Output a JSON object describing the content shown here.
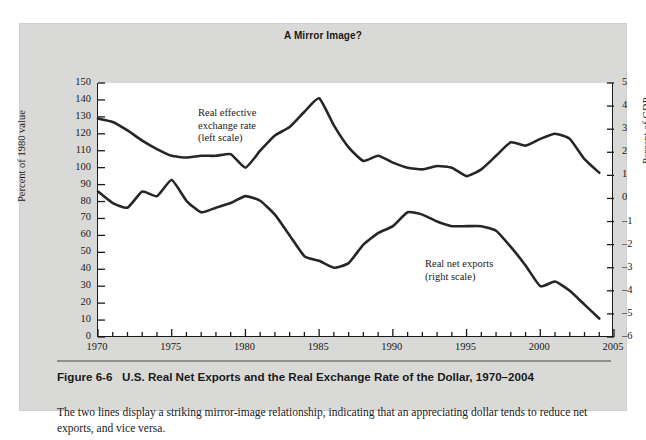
{
  "figure": {
    "panel_background": "#d9d9d7",
    "title": "A Mirror Image?",
    "heading_number": "Figure 6-6",
    "heading_text": "U.S. Real Net Exports and the Real Exchange Rate of the Dollar, 1970–2004",
    "caption": "The two lines display a striking mirror-image relationship, indicating that an appreciating dollar tends to reduce net exports, and vice versa."
  },
  "chart_data": {
    "type": "line",
    "title": "A Mirror Image?",
    "xlabel": "",
    "ylabel": "Percent of 1980 value",
    "ylabel_right": "Percent of GDP",
    "xlim": [
      1970,
      2005
    ],
    "ylim": [
      0,
      150
    ],
    "ylim_right": [
      -6,
      5
    ],
    "grid": false,
    "legend": "inline-annotations",
    "line_color": "#262626",
    "x_ticks": [
      1970,
      1975,
      1980,
      1985,
      1990,
      1995,
      2000,
      2005
    ],
    "x_minor_tick_step": 1,
    "y_ticks_left": [
      0,
      10,
      20,
      30,
      40,
      50,
      60,
      70,
      80,
      90,
      100,
      110,
      120,
      130,
      140,
      150
    ],
    "y_ticks_right": [
      -6,
      -5,
      -4,
      -3,
      -2,
      -1,
      0,
      1,
      2,
      3,
      4,
      5
    ],
    "series": [
      {
        "name": "Real effective exchange rate",
        "annotation": "Real effective\nexchange rate\n(left scale)",
        "annotation_line1": "Real effective",
        "annotation_line2": "exchange rate",
        "annotation_line3": "(left scale)",
        "axis": "left",
        "x": [
          1970,
          1971,
          1972,
          1973,
          1974,
          1975,
          1976,
          1977,
          1978,
          1979,
          1980,
          1981,
          1982,
          1983,
          1984,
          1985,
          1986,
          1987,
          1988,
          1989,
          1990,
          1991,
          1992,
          1993,
          1994,
          1995,
          1996,
          1997,
          1998,
          1999,
          2000,
          2001,
          2002,
          2003,
          2004
        ],
        "values": [
          129,
          127,
          122,
          116,
          111,
          107,
          106,
          107,
          107,
          108,
          100,
          110,
          119,
          124,
          133,
          141,
          125,
          112,
          104,
          107,
          103,
          100,
          99,
          101,
          100,
          95,
          99,
          107,
          115,
          113,
          117,
          120,
          117,
          105,
          97
        ]
      },
      {
        "name": "Real net exports",
        "annotation": "Real net exports\n(right scale)",
        "annotation_line1": "Real net exports",
        "annotation_line2": "(right scale)",
        "axis": "right",
        "x": [
          1970,
          1971,
          1972,
          1973,
          1974,
          1975,
          1976,
          1977,
          1978,
          1979,
          1980,
          1981,
          1982,
          1983,
          1984,
          1985,
          1986,
          1987,
          1988,
          1989,
          1990,
          1991,
          1992,
          1993,
          1994,
          1995,
          1996,
          1997,
          1998,
          1999,
          2000,
          2001,
          2002,
          2003,
          2004
        ],
        "values": [
          0.3,
          -0.2,
          -0.4,
          0.3,
          0.1,
          0.8,
          -0.1,
          -0.6,
          -0.4,
          -0.2,
          0.1,
          -0.1,
          -0.7,
          -1.6,
          -2.5,
          -2.7,
          -3.0,
          -2.8,
          -2.0,
          -1.5,
          -1.2,
          -0.6,
          -0.7,
          -1.0,
          -1.2,
          -1.2,
          -1.2,
          -1.4,
          -2.1,
          -2.9,
          -3.8,
          -3.6,
          -4.0,
          -4.6,
          -5.2
        ]
      }
    ]
  },
  "axes": {
    "left_title": "Percent of 1980 value",
    "right_title": "Percent of GDP",
    "left_ticks": [
      "150",
      "140",
      "130",
      "120",
      "110",
      "100",
      "90",
      "80",
      "70",
      "60",
      "50",
      "40",
      "30",
      "20",
      "10",
      "0"
    ],
    "right_ticks": [
      "5",
      "4",
      "3",
      "2",
      "1",
      "0",
      "–1",
      "–2",
      "–3",
      "–4",
      "–5",
      "–6"
    ],
    "x_ticks": [
      "1970",
      "1975",
      "1980",
      "1985",
      "1990",
      "1995",
      "2000",
      "2005"
    ]
  }
}
